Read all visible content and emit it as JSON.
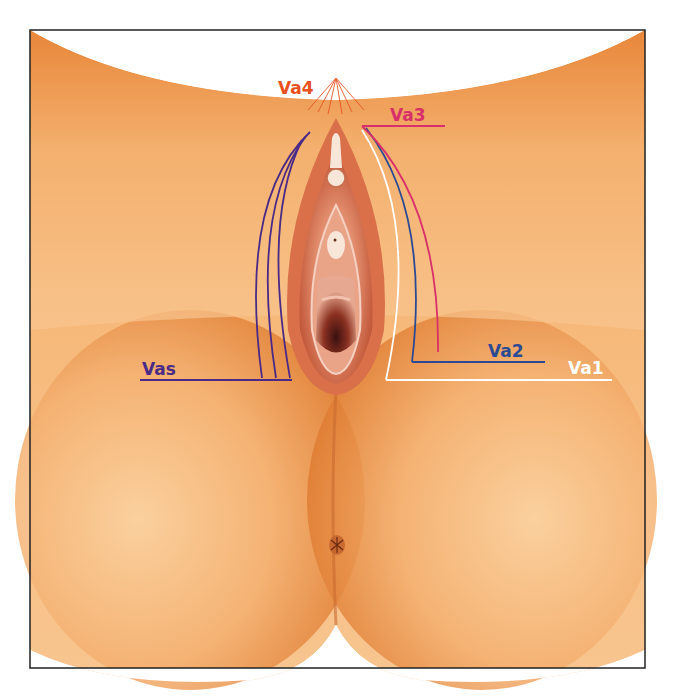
{
  "figure": {
    "colors": {
      "skin_light": "#f8c08a",
      "skin_mid": "#f0a05a",
      "skin_dark": "#d86a22",
      "tissue": "#c8553a",
      "tissue_light": "#f2b6a0",
      "frame": "#222222"
    }
  },
  "labels": [
    {
      "id": "vas",
      "text": "Vas",
      "color": "#4a2a86"
    },
    {
      "id": "va1",
      "text": "Va1",
      "color": "#ffffff"
    },
    {
      "id": "va2",
      "text": "Va2",
      "color": "#2c4a94"
    },
    {
      "id": "va3",
      "text": "Va3",
      "color": "#d8306a"
    },
    {
      "id": "va4",
      "text": "Va4",
      "color": "#e8501e"
    }
  ]
}
